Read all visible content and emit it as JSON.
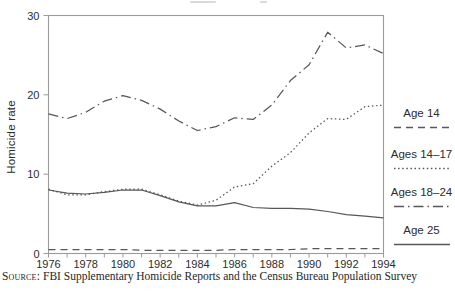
{
  "y_axis": {
    "label": "Homicide rate",
    "ticks": [
      0,
      10,
      20,
      30
    ]
  },
  "x_axis": {
    "tick_years": [
      1976,
      1977,
      1978,
      1979,
      1980,
      1981,
      1982,
      1983,
      1984,
      1985,
      1986,
      1987,
      1988,
      1989,
      1990,
      1991,
      1992,
      1993,
      1994
    ],
    "label_years": [
      1976,
      1978,
      1980,
      1982,
      1984,
      1986,
      1988,
      1990,
      1992,
      1994
    ]
  },
  "legend": [
    {
      "label": "Age 14",
      "style": "dashed"
    },
    {
      "label": "Ages 14–17",
      "style": "dotted"
    },
    {
      "label": "Ages 18–24",
      "style": "dashdot"
    },
    {
      "label": "Age 25",
      "style": "solid"
    }
  ],
  "source": {
    "prefix": "Source:",
    "text": " FBI Supplementary Homicide Reports and the Census Bureau Population Survey"
  },
  "colors": {
    "line": "#575757",
    "axis": "#9b9b9b",
    "text": "#2d2d2d"
  },
  "chart_data": {
    "type": "line",
    "x": [
      1976,
      1977,
      1978,
      1979,
      1980,
      1981,
      1982,
      1983,
      1984,
      1985,
      1986,
      1987,
      1988,
      1989,
      1990,
      1991,
      1992,
      1993,
      1994
    ],
    "series": [
      {
        "name": "Age 14",
        "style": "dashed",
        "values": [
          0.5,
          0.5,
          0.5,
          0.5,
          0.5,
          0.4,
          0.4,
          0.4,
          0.4,
          0.4,
          0.5,
          0.5,
          0.5,
          0.5,
          0.6,
          0.6,
          0.6,
          0.6,
          0.6
        ]
      },
      {
        "name": "Ages 14–17",
        "style": "dotted",
        "values": [
          8.1,
          7.4,
          7.4,
          7.8,
          8.1,
          8.1,
          7.4,
          6.6,
          6.1,
          6.7,
          8.4,
          8.8,
          11.0,
          12.7,
          15.2,
          17.0,
          16.9,
          18.5,
          18.7
        ]
      },
      {
        "name": "Ages 18–24",
        "style": "dashdot",
        "values": [
          17.6,
          17.0,
          17.8,
          19.2,
          19.9,
          19.3,
          18.2,
          16.7,
          15.5,
          16.0,
          17.1,
          16.9,
          18.7,
          21.8,
          23.8,
          27.9,
          25.9,
          26.3,
          25.2
        ]
      },
      {
        "name": "Age 25",
        "style": "solid",
        "values": [
          8.0,
          7.6,
          7.5,
          7.7,
          8.0,
          8.0,
          7.3,
          6.5,
          6.0,
          6.0,
          6.4,
          5.8,
          5.7,
          5.7,
          5.6,
          5.3,
          4.9,
          4.7,
          4.5
        ]
      }
    ],
    "title": "",
    "xlabel": "",
    "ylabel": "Homicide rate",
    "xlim": [
      1976,
      1994
    ],
    "ylim": [
      0,
      30
    ],
    "grid": false,
    "legend_position": "right"
  }
}
